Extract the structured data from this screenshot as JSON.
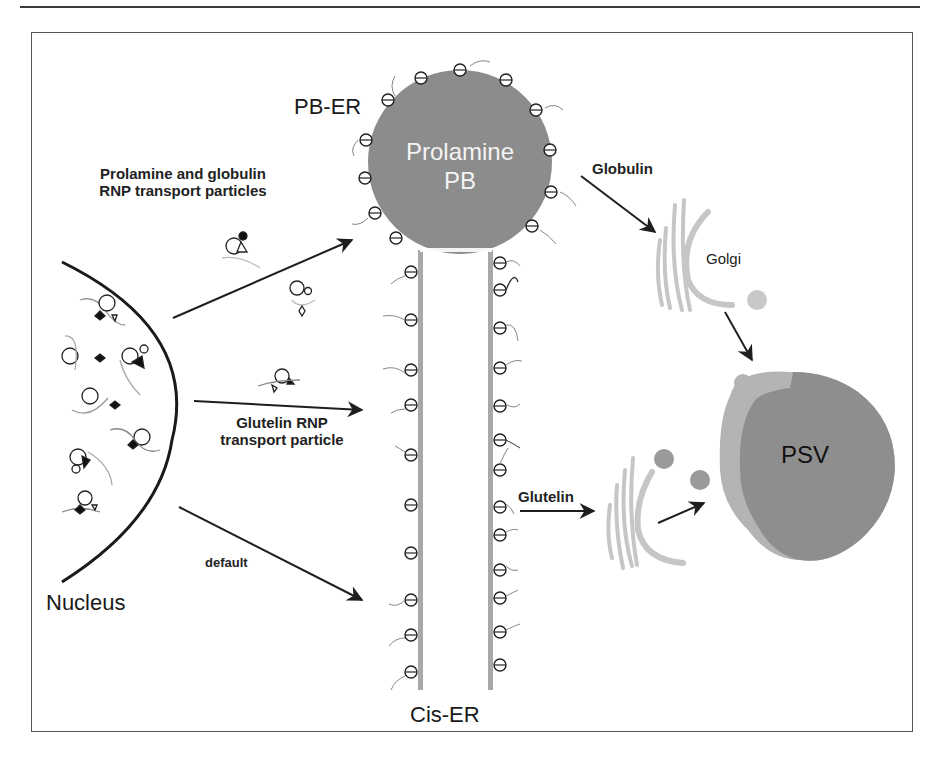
{
  "figure": {
    "labels": {
      "pb_er": "PB-ER",
      "prolamine_pb_line1": "Prolamine",
      "prolamine_pb_line2": "PB",
      "prolamine_globulin_line1": "Prolamine and globulin",
      "prolamine_globulin_line2": "RNP transport particles",
      "globulin": "Globulin",
      "golgi": "Golgi",
      "glutelin_rnp_line1": "Glutelin RNP",
      "glutelin_rnp_line2": "transport particle",
      "glutelin": "Glutelin",
      "psv": "PSV",
      "nucleus": "Nucleus",
      "default": "default",
      "cis_er": "Cis-ER"
    },
    "colors": {
      "prolamine_pb": "#8c8c8c",
      "er_membrane": "#a8a8a8",
      "golgi": "#c6c6c6",
      "psv_outer": "#b4b4b4",
      "psv_inner": "#8e8e8e",
      "vesicle": "#9a9a9a",
      "arrow": "#1e1e1e",
      "frame": "#555555"
    }
  }
}
